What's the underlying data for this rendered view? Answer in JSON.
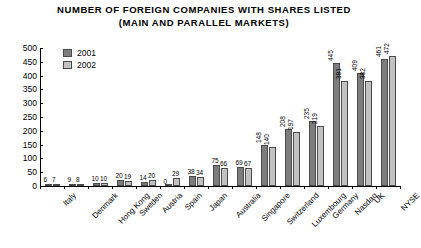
{
  "chart_data": {
    "type": "bar",
    "title": "NUMBER OF FOREIGN COMPANIES WITH SHARES LISTED (MAIN AND PARALLEL MARKETS)",
    "title_line1": "NUMBER OF FOREIGN COMPANIES WITH SHARES LISTED",
    "title_line2": "(MAIN AND PARALLEL MARKETS)",
    "xlabel": "",
    "ylabel": "",
    "ylim": [
      0,
      500
    ],
    "yticks": [
      0,
      50,
      100,
      150,
      200,
      250,
      300,
      350,
      400,
      450,
      500
    ],
    "grid": false,
    "legend_position": "top-left",
    "categories": [
      "Italy",
      "Denmark",
      "Hong Kong",
      "Sweden",
      "Austria",
      "Spain",
      "Japan",
      "Australia",
      "Singapore",
      "Switzerland",
      "Luxembourg",
      "Germany",
      "Nasdaq",
      "UK",
      "NYSE"
    ],
    "series": [
      {
        "name": "2001",
        "color": "#7d7d7d",
        "values": [
          6,
          9,
          10,
          20,
          14,
          0,
          38,
          75,
          69,
          148,
          208,
          235,
          445,
          409,
          461
        ]
      },
      {
        "name": "2002",
        "color": "#c2c2c2",
        "values": [
          7,
          8,
          10,
          19,
          20,
          29,
          34,
          66,
          67,
          140,
          197,
          219,
          381,
          382,
          472
        ]
      }
    ]
  },
  "legend": {
    "items": [
      {
        "label": "2001",
        "color": "#7d7d7d"
      },
      {
        "label": "2002",
        "color": "#c2c2c2"
      }
    ]
  }
}
